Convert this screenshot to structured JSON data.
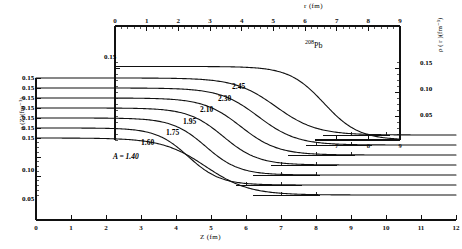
{
  "figure": {
    "top_panel": {
      "x_axis": {
        "label": "r (fm)",
        "min": 0,
        "max": 9,
        "ticks": [
          0,
          1,
          2,
          3,
          4,
          5,
          6,
          7,
          8,
          9
        ],
        "minor_per_major": 5
      },
      "y_axis": {
        "label": "ρ ( r )(fm⁻³)",
        "ticks": [
          0.05,
          0.1,
          0.15
        ],
        "tick_labels": [
          "0.05",
          "0.10",
          "0.15"
        ],
        "min": 0,
        "max": 0.175
      },
      "left_tick_label": "0.15",
      "curve_label": "²⁰⁸Pb"
    },
    "main_panel": {
      "x_axis": {
        "label": "Z (fm)",
        "min": 0,
        "max": 12,
        "ticks": [
          0,
          1,
          2,
          3,
          4,
          5,
          6,
          7,
          8,
          9,
          10,
          11,
          12
        ]
      },
      "y_axis": {
        "label": "ρ (Z)(fm⁻³)",
        "ticks": [
          0.05,
          0.1,
          0.15
        ],
        "tick_labels": [
          "0.05",
          "0.10",
          "0.15"
        ],
        "min": 0,
        "max": 0.15
      },
      "stacked_tick_labels": [
        "0.15",
        "0.15",
        "0.15",
        "0.15",
        "0.15",
        "0.15",
        "0.15"
      ],
      "first_curve_label": "A = 1.40"
    },
    "curve_labels": [
      "2.45",
      "2.30",
      "2.10",
      "1.95",
      "1.75",
      "1.60",
      "A = 1.40"
    ]
  },
  "chart_data": {
    "type": "line",
    "title": "",
    "xlabel": "Z (fm)",
    "ylabel": "ρ (Z)(fm⁻³)",
    "xlim": [
      0,
      12
    ],
    "ylim": [
      0,
      0.15
    ],
    "grid": false,
    "legend": "inline curve labels",
    "secondary_axes": {
      "top_xlabel": "r (fm)",
      "top_xlim": [
        0,
        9
      ],
      "right_ylabel": "ρ ( r )(fm⁻³)",
      "right_ylim": [
        0,
        0.175
      ],
      "right_yticks": [
        0.05,
        0.1,
        0.15
      ]
    },
    "note": "Each rho(Z) curve is a two-parameter Fermi form rho0/(1+exp((Z-c)/a)) with rho0 = 0.15 fm^-3, plotted with a cumulative vertical offset of 0.15 per curve (topmost = A 2.45).",
    "series": [
      {
        "name": "208Pb",
        "panel": "top",
        "x_var": "r",
        "half_density_radius": 6.6,
        "surface_diffuseness": 0.55,
        "rho0": 0.155,
        "x": [
          0,
          0.5,
          1,
          1.5,
          2,
          2.5,
          3,
          3.5,
          4,
          4.5,
          5,
          5.5,
          6,
          6.5,
          7,
          7.5,
          8,
          8.5,
          9
        ],
        "y": [
          0.155,
          0.155,
          0.1548,
          0.1545,
          0.154,
          0.1532,
          0.152,
          0.1503,
          0.1475,
          0.1425,
          0.1345,
          0.12,
          0.0985,
          0.072,
          0.0465,
          0.0268,
          0.0145,
          0.0075,
          0.0038
        ]
      },
      {
        "name": "2.45",
        "panel": "main",
        "offset_index": 6,
        "c": 6.85,
        "a": 0.58,
        "rho0": 0.15,
        "x": [
          0,
          1,
          2,
          3,
          4,
          5,
          5.5,
          6,
          6.5,
          7,
          7.5,
          8,
          8.5,
          9,
          9.5,
          10,
          10.5,
          11,
          11.5,
          12
        ],
        "y": [
          0.15,
          0.15,
          0.1498,
          0.1494,
          0.1485,
          0.145,
          0.1405,
          0.131,
          0.115,
          0.093,
          0.069,
          0.047,
          0.03,
          0.0185,
          0.011,
          0.0065,
          0.0038,
          0.0022,
          0.0013,
          0.0008
        ]
      },
      {
        "name": "2.30",
        "panel": "main",
        "offset_index": 5,
        "c": 6.35,
        "a": 0.55,
        "rho0": 0.15,
        "x": [
          0,
          1,
          2,
          3,
          4,
          4.5,
          5,
          5.5,
          6,
          6.5,
          7,
          7.5,
          8,
          8.5,
          9,
          9.5,
          10,
          10.5,
          11,
          11.5,
          12
        ],
        "y": [
          0.15,
          0.15,
          0.1497,
          0.1492,
          0.1478,
          0.146,
          0.1425,
          0.136,
          0.123,
          0.103,
          0.079,
          0.055,
          0.0355,
          0.0215,
          0.0128,
          0.0075,
          0.0044,
          0.0025,
          0.0015,
          0.0009,
          0.0005
        ]
      },
      {
        "name": "2.10",
        "panel": "main",
        "offset_index": 4,
        "c": 5.85,
        "a": 0.53,
        "rho0": 0.15,
        "x": [
          0,
          1,
          2,
          3,
          4,
          4.5,
          5,
          5.5,
          6,
          6.5,
          7,
          7.5,
          8,
          8.5,
          9,
          9.5,
          10,
          10.5,
          11,
          11.5,
          12
        ],
        "y": [
          0.15,
          0.15,
          0.1496,
          0.149,
          0.1472,
          0.1448,
          0.14,
          0.131,
          0.115,
          0.092,
          0.067,
          0.045,
          0.028,
          0.0168,
          0.0098,
          0.0057,
          0.0033,
          0.0019,
          0.0011,
          0.0006,
          0.0004
        ]
      },
      {
        "name": "1.95",
        "panel": "main",
        "offset_index": 3,
        "c": 5.35,
        "a": 0.5,
        "rho0": 0.15,
        "x": [
          0,
          1,
          2,
          3,
          3.5,
          4,
          4.5,
          5,
          5.5,
          6,
          6.5,
          7,
          7.5,
          8,
          8.5,
          9,
          9.5,
          10,
          10.5,
          11,
          11.5,
          12
        ],
        "y": [
          0.15,
          0.1499,
          0.1495,
          0.1486,
          0.1476,
          0.1458,
          0.1425,
          0.1365,
          0.125,
          0.106,
          0.081,
          0.056,
          0.0355,
          0.0212,
          0.0122,
          0.007,
          0.004,
          0.0023,
          0.0013,
          0.0007,
          0.0004,
          0.0002
        ]
      },
      {
        "name": "1.75",
        "panel": "main",
        "offset_index": 2,
        "c": 4.85,
        "a": 0.48,
        "rho0": 0.15,
        "x": [
          0,
          1,
          2,
          3,
          3.5,
          4,
          4.5,
          5,
          5.5,
          6,
          6.5,
          7,
          7.5,
          8,
          8.5,
          9,
          9.5,
          10,
          10.5,
          11,
          11.5,
          12
        ],
        "y": [
          0.15,
          0.1498,
          0.1494,
          0.1482,
          0.147,
          0.1448,
          0.1405,
          0.133,
          0.119,
          0.0975,
          0.0715,
          0.0475,
          0.0292,
          0.017,
          0.0097,
          0.0055,
          0.0031,
          0.0017,
          0.001,
          0.0006,
          0.0003,
          0.0002
        ]
      },
      {
        "name": "1.60",
        "panel": "main",
        "offset_index": 1,
        "c": 4.35,
        "a": 0.46,
        "rho0": 0.15,
        "x": [
          0,
          1,
          2,
          3,
          3.5,
          4,
          4.5,
          5,
          5.5,
          6,
          6.5,
          7,
          7.5,
          8,
          8.5,
          9,
          9.5,
          10,
          10.5,
          11,
          11.5,
          12
        ],
        "y": [
          0.15,
          0.1497,
          0.1491,
          0.1476,
          0.146,
          0.1432,
          0.1378,
          0.1285,
          0.112,
          0.0885,
          0.062,
          0.0395,
          0.0235,
          0.0133,
          0.0074,
          0.0041,
          0.0023,
          0.0013,
          0.0007,
          0.0004,
          0.0002,
          0.0001
        ]
      },
      {
        "name": "A = 1.40",
        "panel": "main",
        "offset_index": 0,
        "c": 4.85,
        "a": 0.62,
        "rho0": 0.15,
        "x": [
          0,
          1,
          2,
          3,
          3.5,
          4,
          4.5,
          5,
          5.5,
          6,
          6.5,
          7,
          7.5,
          8,
          8.5,
          9,
          9.5,
          10,
          10.5,
          11,
          11.5,
          12
        ],
        "y": [
          0.15,
          0.1498,
          0.1492,
          0.147,
          0.1448,
          0.1405,
          0.133,
          0.121,
          0.104,
          0.083,
          0.061,
          0.0415,
          0.0265,
          0.0162,
          0.0096,
          0.0056,
          0.0032,
          0.0019,
          0.0011,
          0.0006,
          0.0003,
          0.0002
        ]
      }
    ]
  }
}
